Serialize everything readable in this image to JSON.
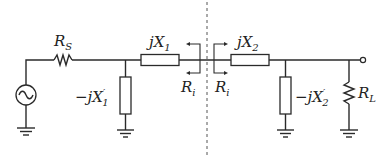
{
  "diagram": {
    "type": "circuit-schematic",
    "components": {
      "source": {
        "label": "",
        "type": "ac-voltage-source"
      },
      "source_resistor": {
        "symbol": "R",
        "subscript": "S",
        "type": "resistor"
      },
      "shunt1": {
        "prefix": "−j",
        "symbol": "X",
        "prime": "′",
        "subscript": "1",
        "type": "reactance"
      },
      "series1": {
        "prefix": "j",
        "symbol": "X",
        "subscript": "1",
        "type": "reactance"
      },
      "series2": {
        "prefix": "j",
        "symbol": "X",
        "subscript": "2",
        "type": "reactance"
      },
      "shunt2": {
        "prefix": "−j",
        "symbol": "X",
        "prime": "′",
        "subscript": "2",
        "type": "reactance"
      },
      "load": {
        "symbol": "R",
        "subscript": "L",
        "type": "resistor"
      }
    },
    "interface": {
      "left_label": {
        "symbol": "R",
        "subscript": "i"
      },
      "right_label": {
        "symbol": "R",
        "subscript": "i"
      }
    },
    "colors": {
      "line": "#2a2a2a",
      "background": "#ffffff",
      "divider": "#555555"
    }
  }
}
